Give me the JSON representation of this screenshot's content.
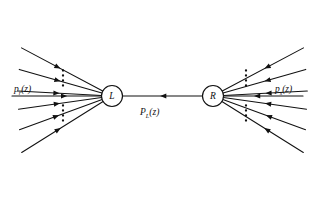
{
  "figure": {
    "background": "#ffffff",
    "stroke_color": "#111111",
    "width": 315,
    "height": 203
  },
  "vertices": [
    {
      "id": "L",
      "label": "L",
      "cx": 112,
      "cy": 96,
      "r": 10.5
    },
    {
      "id": "R",
      "label": "R",
      "cx": 213,
      "cy": 96,
      "r": 10.5
    }
  ],
  "labels": {
    "left_momentum": {
      "base": "p",
      "sub": "r",
      "arg": "(z)",
      "x": 14,
      "y": 92
    },
    "right_momentum": {
      "base": "p",
      "sub": "s",
      "arg": "(z)",
      "x": 275,
      "y": 92
    },
    "center_propagator": {
      "base": "P",
      "sub": "L",
      "arg": "(z)",
      "x": 140,
      "y": 115
    }
  },
  "horizontal_lines": [
    {
      "name": "left-incoming",
      "x1": 12,
      "y1": 96,
      "x2": 101,
      "y2": 96,
      "arrow_at": 0.62,
      "arrow_dir": "right"
    },
    {
      "name": "center-propagator",
      "x1": 123,
      "y1": 96,
      "x2": 202,
      "y2": 96,
      "arrow_at": 0.47,
      "arrow_dir": "left"
    },
    {
      "name": "right-incoming",
      "x1": 303,
      "y1": 96,
      "x2": 224,
      "y2": 96,
      "arrow_at": 0.62,
      "arrow_dir": "left"
    }
  ],
  "left_rays": [
    {
      "angle_deg": 208,
      "length": 92,
      "arrow_at": 0.52
    },
    {
      "angle_deg": 196,
      "length": 86,
      "arrow_at": 0.5
    },
    {
      "angle_deg": 183,
      "length": 84,
      "arrow_at": 0.5
    },
    {
      "angle_deg": 172,
      "length": 84,
      "arrow_at": 0.5
    },
    {
      "angle_deg": 160,
      "length": 88,
      "arrow_at": 0.52
    },
    {
      "angle_deg": 148,
      "length": 96,
      "arrow_at": 0.52
    }
  ],
  "right_rays": [
    {
      "angle_deg": 332,
      "length": 92,
      "arrow_at": 0.52
    },
    {
      "angle_deg": 344,
      "length": 86,
      "arrow_at": 0.5
    },
    {
      "angle_deg": 357,
      "length": 84,
      "arrow_at": 0.5
    },
    {
      "angle_deg": 8,
      "length": 84,
      "arrow_at": 0.5
    },
    {
      "angle_deg": 20,
      "length": 88,
      "arrow_at": 0.52
    },
    {
      "angle_deg": 32,
      "length": 96,
      "arrow_at": 0.52
    }
  ],
  "ellipses": [
    {
      "name": "left-upper-dots",
      "cx": 63,
      "cy": 78,
      "dots": 4,
      "spacing": 5
    },
    {
      "name": "left-lower-dots",
      "cx": 63,
      "cy": 113,
      "dots": 4,
      "spacing": 5
    },
    {
      "name": "right-upper-dots",
      "cx": 246,
      "cy": 78,
      "dots": 4,
      "spacing": 5
    },
    {
      "name": "right-lower-dots",
      "cx": 246,
      "cy": 113,
      "dots": 4,
      "spacing": 5
    }
  ]
}
